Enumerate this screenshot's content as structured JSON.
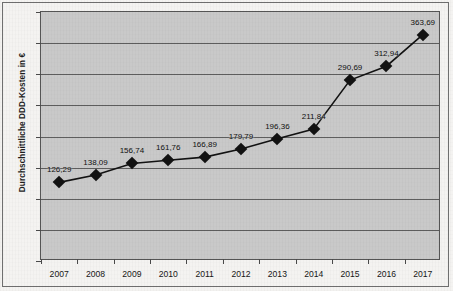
{
  "chart_data": {
    "type": "line",
    "title": "",
    "xlabel": "",
    "ylabel": "Durchschnittliche DDD-Kosten in €",
    "categories": [
      "2007",
      "2008",
      "2009",
      "2010",
      "2011",
      "2012",
      "2013",
      "2014",
      "2015",
      "2016",
      "2017"
    ],
    "values": [
      126.29,
      138.09,
      156.74,
      161.76,
      166.89,
      179.79,
      196.36,
      211.84,
      290.69,
      312.94,
      363.69
    ],
    "point_labels": [
      "126,29",
      "138,09",
      "156,74",
      "161,76",
      "166,89",
      "179,79",
      "196,36",
      "211,84",
      "290,69",
      "312,94",
      "363,69"
    ],
    "ylim": [
      0,
      400
    ],
    "ytick_values": [
      0,
      50,
      100,
      150,
      200,
      250,
      300,
      350,
      400
    ],
    "ytick_labels": [
      "0",
      "50",
      "100",
      "150",
      "200",
      "250",
      "300",
      "350",
      "400"
    ],
    "grid": true,
    "legend": "none",
    "marker": "diamond",
    "series_color": "#121212",
    "plot_background": "#c9c9c9",
    "gridline_color": "#5e5e5e",
    "figure_background": "#f4f3f1"
  }
}
